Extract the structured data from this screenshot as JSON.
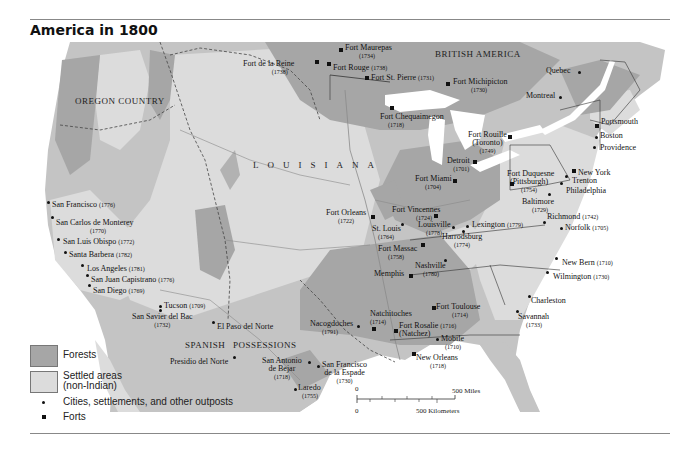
{
  "title": "America in 1800",
  "colors": {
    "forest": "#a6a6a6",
    "settled": "#dcdcdc",
    "land": "#c4c4c4",
    "water": "#ffffff",
    "ink": "#111111"
  },
  "regions": {
    "oregon": "OREGON COUNTRY",
    "louisiana": "LOUISIANA",
    "british": "BRITISH AMERICA",
    "spanish_1": "SPANISH",
    "spanish_2": "POSSESSIONS"
  },
  "places": {
    "fort_de_la_reine": {
      "name": "Fort de la Reine",
      "year": "(1738)"
    },
    "fort_maurepas": {
      "name": "Fort Maurepas",
      "year": "(1734)"
    },
    "fort_rouge": {
      "name": "Fort Rouge",
      "year": "(1738)"
    },
    "fort_st_pierre": {
      "name": "Fort St. Pierre",
      "year": "(1731)"
    },
    "fort_michipicton": {
      "name": "Fort Michipicton",
      "year": "(1730)"
    },
    "fort_chequaimegon": {
      "name": "Fort Chequaimegon",
      "year": "(1718)"
    },
    "quebec": {
      "name": "Quebec"
    },
    "montreal": {
      "name": "Montreal"
    },
    "portsmouth": {
      "name": "Portsmouth"
    },
    "boston": {
      "name": "Boston"
    },
    "providence": {
      "name": "Providence"
    },
    "fort_rouille": {
      "name": "Fort Rouille",
      "name2": "(Toronto)",
      "year": "(1749)"
    },
    "detroit": {
      "name": "Detroit",
      "year": "(1701)"
    },
    "fort_miami": {
      "name": "Fort Miami",
      "year": "(1704)"
    },
    "fort_duquesne": {
      "name": "Fort Duquesne",
      "name2": "(Pittsburgh)",
      "year": "(1754)"
    },
    "new_york": {
      "name": "New York"
    },
    "trenton": {
      "name": "Trenton"
    },
    "philadelphia": {
      "name": "Philadelphia"
    },
    "baltimore": {
      "name": "Baltimore",
      "year": "(1729)"
    },
    "richmond": {
      "name": "Richmond",
      "year": "(1742)"
    },
    "norfolk": {
      "name": "Norfolk",
      "year": "(1705)"
    },
    "fort_vincennes": {
      "name": "Fort Vincennes",
      "year": "(1724)"
    },
    "fort_orleans": {
      "name": "Fort Orleans",
      "year": "(1722)"
    },
    "st_louis": {
      "name": "St. Louis",
      "year": "(1764)"
    },
    "louisville": {
      "name": "Louisville",
      "year": "(1778)"
    },
    "lexington": {
      "name": "Lexington",
      "year": "(1779)"
    },
    "harrodsburg": {
      "name": "Harrodsburg",
      "year": "(1774)"
    },
    "fort_massac": {
      "name": "Fort Massac",
      "year": "(1758)"
    },
    "nashville": {
      "name": "Nashville",
      "year": "(1780)"
    },
    "memphis": {
      "name": "Memphis"
    },
    "new_bern": {
      "name": "New Bern",
      "year": "(1710)"
    },
    "wilmington": {
      "name": "Wilmington",
      "year": "(1730)"
    },
    "charleston": {
      "name": "Charleston"
    },
    "savannah": {
      "name": "Savannah",
      "year": "(1733)"
    },
    "fort_toulouse": {
      "name": "Fort Toulouse",
      "year": "(1714)"
    },
    "fort_rosalie": {
      "name": "Fort Rosalie",
      "year": "(1716)",
      "name2": "(Natchez)"
    },
    "natchitoches": {
      "name": "Natchitoches",
      "year": "(1714)"
    },
    "nacogdoches": {
      "name": "Nacogdoches",
      "year": "(1791)"
    },
    "mobile": {
      "name": "Mobile",
      "year": "(1710)"
    },
    "new_orleans": {
      "name": "New Orleans",
      "year": "(1718)"
    },
    "san_antonio": {
      "name": "San Antonio",
      "name2": "de Bejar",
      "year": "(1718)"
    },
    "san_francisco_espade": {
      "name": "San Francisco",
      "name2": "de la Espade",
      "year": "(1730)"
    },
    "laredo": {
      "name": "Laredo",
      "year": "(1755)"
    },
    "presidio": {
      "name": "Presidio del Norte"
    },
    "el_paso": {
      "name": "El Paso del Norte"
    },
    "tucson": {
      "name": "Tucson",
      "year": "(1709)"
    },
    "san_xavier": {
      "name": "San Savier del Bac",
      "year": "(1732)"
    },
    "san_francisco": {
      "name": "San Francisco",
      "year": "(1776)"
    },
    "monterey": {
      "name": "San Carlos de Monterey",
      "year": "(1770)"
    },
    "san_luis": {
      "name": "San Luis Obispo",
      "year": "(1772)"
    },
    "santa_barbara": {
      "name": "Santa Barbera",
      "year": "(1782)"
    },
    "los_angeles": {
      "name": "Los Angeles",
      "year": "(1781)"
    },
    "san_juan": {
      "name": "San Juan Capistrano",
      "year": "(1776)"
    },
    "san_diego": {
      "name": "San Diego",
      "year": "(1769)"
    }
  },
  "legend": {
    "forests": "Forests",
    "settled_1": "Settled areas",
    "settled_2": "(non-Indian)",
    "cities": "Cities, settlements, and other outposts",
    "forts": "Forts"
  },
  "scale": {
    "zero_top": "0",
    "miles": "500 Miles",
    "zero_bottom": "0",
    "km": "500 Kilometers"
  }
}
